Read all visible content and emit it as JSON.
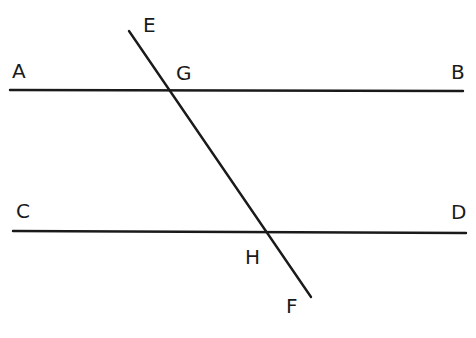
{
  "diagram": {
    "type": "parallel lines cut by a transversal",
    "stroke_color": "#1a1a1a",
    "background": "#ffffff",
    "lines": [
      {
        "id": "AB",
        "x1": 10,
        "y1": 90,
        "x2": 463,
        "y2": 91
      },
      {
        "id": "CD",
        "x1": 13,
        "y1": 231,
        "x2": 466,
        "y2": 233
      },
      {
        "id": "EF",
        "x1": 129,
        "y1": 31,
        "x2": 311,
        "y2": 297
      }
    ],
    "labels": [
      {
        "text": "A",
        "x": 12,
        "y": 78
      },
      {
        "text": "B",
        "x": 451,
        "y": 79
      },
      {
        "text": "C",
        "x": 16,
        "y": 218
      },
      {
        "text": "D",
        "x": 451,
        "y": 219
      },
      {
        "text": "E",
        "x": 143,
        "y": 32
      },
      {
        "text": "G",
        "x": 176,
        "y": 80
      },
      {
        "text": "H",
        "x": 245,
        "y": 264
      },
      {
        "text": "F",
        "x": 286,
        "y": 313
      }
    ]
  }
}
